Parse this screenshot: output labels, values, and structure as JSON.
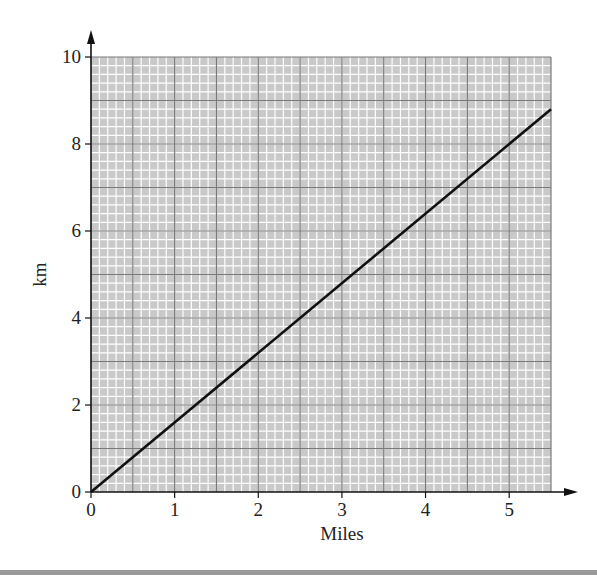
{
  "chart_data": {
    "type": "line",
    "title": "",
    "xlabel": "Miles",
    "ylabel": "km",
    "x_ticks": [
      "0",
      "1",
      "2",
      "3",
      "4",
      "5"
    ],
    "y_ticks": [
      "0",
      "2",
      "4",
      "6",
      "8",
      "10"
    ],
    "xlim": [
      0,
      5.5
    ],
    "ylim": [
      0,
      10
    ],
    "grid": true,
    "legend": null,
    "series": [
      {
        "name": "miles to km",
        "x": [
          0,
          5.5
        ],
        "values": [
          0,
          8.8
        ]
      }
    ]
  },
  "colors": {
    "grid_bg": "#c9c9c9",
    "minor_grid": "#ffffff",
    "major_grid": "#7a7a7a",
    "line": "#111111",
    "axis": "#111111"
  }
}
